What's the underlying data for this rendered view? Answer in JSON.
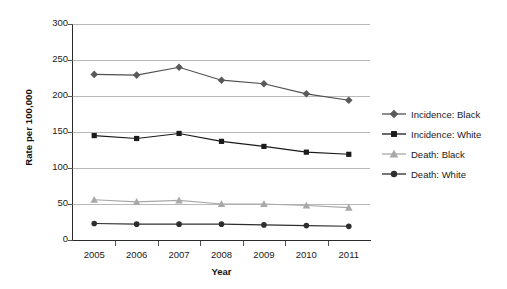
{
  "chart_data": {
    "type": "line",
    "title": "",
    "xlabel": "Year",
    "ylabel": "Rate per 100,000",
    "categories": [
      "2005",
      "2006",
      "2007",
      "2008",
      "2009",
      "2010",
      "2011"
    ],
    "x": [
      2005,
      2006,
      2007,
      2008,
      2009,
      2010,
      2011
    ],
    "ylim": [
      0,
      300
    ],
    "yticks": [
      0,
      50,
      100,
      150,
      200,
      250,
      300
    ],
    "ytick_labels": [
      "0",
      "50",
      "100",
      "150",
      "200",
      "250",
      "300"
    ],
    "grid": "horizontal",
    "legend_position": "right",
    "series": [
      {
        "name": "Incidence: Black",
        "marker": "diamond",
        "color": "#5a5a5a",
        "line_color": "#4f4f4f",
        "values": [
          230,
          229,
          240,
          222,
          217,
          203,
          194
        ]
      },
      {
        "name": "Incidence: White",
        "marker": "square",
        "color": "#1a1a1a",
        "line_color": "#1a1a1a",
        "values": [
          145,
          141,
          148,
          137,
          130,
          122,
          119
        ]
      },
      {
        "name": "Death: Black",
        "marker": "triangle",
        "color": "#a8a8a8",
        "line_color": "#a8a8a8",
        "values": [
          56,
          53,
          55,
          50,
          50,
          48,
          45
        ]
      },
      {
        "name": "Death: White",
        "marker": "circle",
        "color": "#2e2e2e",
        "line_color": "#2e2e2e",
        "values": [
          23,
          22,
          22,
          22,
          21,
          20,
          19
        ]
      }
    ]
  },
  "legend": {
    "items": [
      {
        "label": "Incidence: Black"
      },
      {
        "label": "Incidence: White"
      },
      {
        "label": "Death: Black"
      },
      {
        "label": "Death: White"
      }
    ]
  },
  "colors": {
    "axis": "#2b2b2b",
    "grid": "#b9b9b9",
    "background": "#ffffff",
    "text": "#1a1a1a"
  }
}
